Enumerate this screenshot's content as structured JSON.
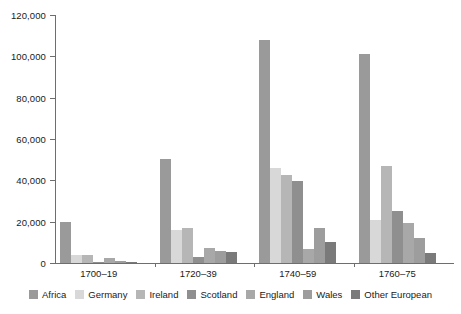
{
  "chart_data": {
    "type": "bar",
    "title": "",
    "subtitle": "",
    "xlabel": "",
    "ylabel": "",
    "ylim": [
      0,
      120000
    ],
    "ytick_step": 20000,
    "grid": false,
    "legend_position": "bottom",
    "categories": [
      "1700–19",
      "1720–39",
      "1740–59",
      "1760–75"
    ],
    "ytick_labels": [
      "120,000",
      "100,000",
      "80,000",
      "60,000",
      "40,000",
      "20,000",
      "0"
    ],
    "ytick_values": [
      120000,
      100000,
      80000,
      60000,
      40000,
      20000,
      0
    ],
    "series": [
      {
        "name": "Africa",
        "color": "#9a9a9a",
        "values": [
          19800,
          50500,
          108000,
          101000
        ]
      },
      {
        "name": "Germany",
        "color": "#d8d8d8",
        "values": [
          3800,
          15900,
          46000,
          21000
        ]
      },
      {
        "name": "Ireland",
        "color": "#b6b6b6",
        "values": [
          4000,
          17000,
          42500,
          47000
        ]
      },
      {
        "name": "Scotland",
        "color": "#8f8f8f",
        "values": [
          400,
          3000,
          39500,
          25000
        ]
      },
      {
        "name": "England",
        "color": "#a8a8a8",
        "values": [
          2300,
          7500,
          7000,
          19500
        ]
      },
      {
        "name": "Wales",
        "color": "#9d9d9d",
        "values": [
          900,
          6000,
          17000,
          12000
        ]
      },
      {
        "name": "Other European",
        "color": "#7a7a7a",
        "values": [
          500,
          5200,
          10000,
          5000
        ]
      }
    ]
  },
  "axis": {
    "axis_color": "#6e6e6e"
  }
}
